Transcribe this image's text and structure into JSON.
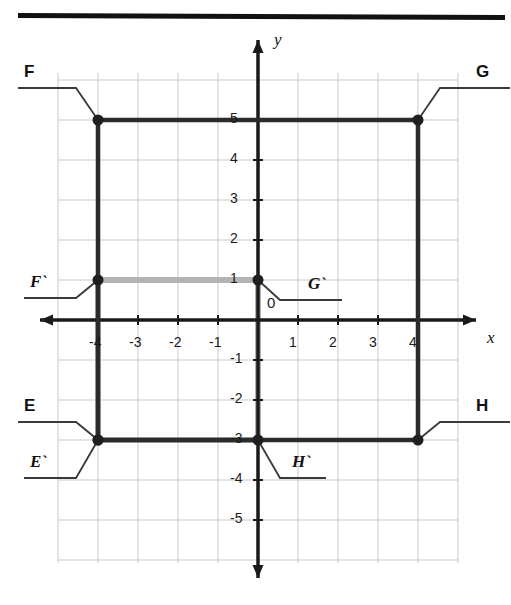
{
  "figure": {
    "type": "coordinate-plane-transformation",
    "top_rule": true,
    "axes": {
      "x_label": "x",
      "y_label": "y",
      "origin_label": "0",
      "x_range": [
        -5,
        5
      ],
      "y_range": [
        -6,
        6
      ],
      "x_ticks": [
        "-4",
        "-3",
        "-2",
        "-1",
        "1",
        "2",
        "3",
        "4"
      ],
      "x_tick_values": [
        -4,
        -3,
        -2,
        -1,
        1,
        2,
        3,
        4
      ],
      "y_ticks": [
        "5",
        "4",
        "3",
        "2",
        "1",
        "-1",
        "-2",
        "-3",
        "-4",
        "-5"
      ],
      "y_tick_values": [
        5,
        4,
        3,
        2,
        1,
        -1,
        -2,
        -3,
        -4,
        -5
      ],
      "grid": true,
      "grid_color": "#c9c9cf",
      "axis_color": "#1a1a1a"
    },
    "shapes": [
      {
        "name": "preimage-EFGH",
        "style": "dark",
        "color": "#2b2b2b",
        "vertices": [
          {
            "label": "E",
            "x": -4,
            "y": -3
          },
          {
            "label": "F",
            "x": -4,
            "y": 5
          },
          {
            "label": "G",
            "x": 4,
            "y": 5
          },
          {
            "label": "H",
            "x": 4,
            "y": -3
          }
        ]
      },
      {
        "name": "image-EFGH-prime",
        "style": "light",
        "color": "#b3b3b3",
        "vertices": [
          {
            "label": "E`",
            "x": -4,
            "y": -3
          },
          {
            "label": "F`",
            "x": -4,
            "y": 1
          },
          {
            "label": "G`",
            "x": 0,
            "y": 1
          },
          {
            "label": "H`",
            "x": 0,
            "y": -3
          }
        ]
      }
    ],
    "callouts": [
      {
        "id": "F",
        "text": "F",
        "kind": "outer",
        "target": {
          "x": -4,
          "y": 5
        },
        "label_pos": {
          "left": 24,
          "top": 62
        }
      },
      {
        "id": "G",
        "text": "G",
        "kind": "outer",
        "target": {
          "x": 4,
          "y": 5
        },
        "label_pos": {
          "left": 476,
          "top": 62
        }
      },
      {
        "id": "E",
        "text": "E",
        "kind": "outer",
        "target": {
          "x": -4,
          "y": -3
        },
        "label_pos": {
          "left": 24,
          "top": 396
        }
      },
      {
        "id": "H",
        "text": "H",
        "kind": "outer",
        "target": {
          "x": 4,
          "y": -3
        },
        "label_pos": {
          "left": 476,
          "top": 396
        }
      },
      {
        "id": "Fp",
        "text": "F`",
        "kind": "image",
        "target": {
          "x": -4,
          "y": 1
        },
        "label_pos": {
          "left": 30,
          "top": 272
        }
      },
      {
        "id": "Gp",
        "text": "G`",
        "kind": "image",
        "target": {
          "x": 0,
          "y": 1
        },
        "label_pos": {
          "left": 308,
          "top": 274
        }
      },
      {
        "id": "Ep",
        "text": "E`",
        "kind": "image",
        "target": {
          "x": -4,
          "y": -3
        },
        "label_pos": {
          "left": 30,
          "top": 452
        }
      },
      {
        "id": "Hp",
        "text": "H`",
        "kind": "image",
        "target": {
          "x": 0,
          "y": -3
        },
        "label_pos": {
          "left": 292,
          "top": 452
        }
      }
    ]
  }
}
